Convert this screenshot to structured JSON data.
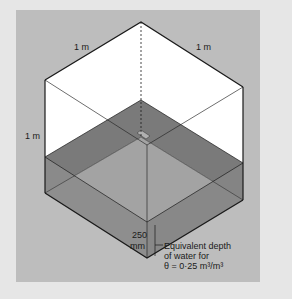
{
  "diagram": {
    "labels": {
      "top_left_edge": "1 m",
      "top_right_edge": "1 m",
      "left_vertical_edge": "1 m",
      "depth_value": "250",
      "depth_unit": "mm",
      "annotation_line1": "Equivalent depth",
      "annotation_line2": "of water for",
      "annotation_line3": "θ = 0·25 m³/m³"
    },
    "colors": {
      "background": "#e6e6e6",
      "panel": "#bdbdbd",
      "cube_face": "#ffffff",
      "water_top": "#7a7a7a",
      "water_front_left": "#8c8c8c",
      "water_front_right": "#858585",
      "inner_floor": "#a3a3a3",
      "edge": "#1a1a1a"
    },
    "values": {
      "cube_side": "1 m",
      "water_depth": "250 mm",
      "theta": "0.25 m3/m3"
    }
  }
}
